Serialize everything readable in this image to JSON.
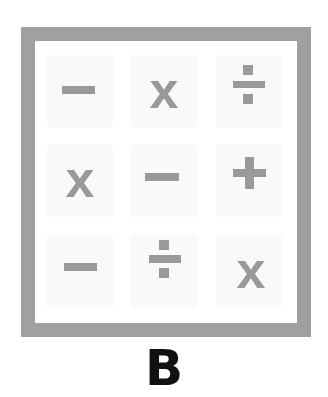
{
  "figure": {
    "label": "B",
    "frame_color": "#a0a0a0",
    "symbol_color": "#999999",
    "grid": [
      [
        {
          "symbol": "minus"
        },
        {
          "symbol": "times",
          "text": "x"
        },
        {
          "symbol": "divide"
        }
      ],
      [
        {
          "symbol": "times",
          "text": "x"
        },
        {
          "symbol": "minus"
        },
        {
          "symbol": "plus"
        }
      ],
      [
        {
          "symbol": "minus"
        },
        {
          "symbol": "divide"
        },
        {
          "symbol": "times",
          "text": "x"
        }
      ]
    ]
  }
}
